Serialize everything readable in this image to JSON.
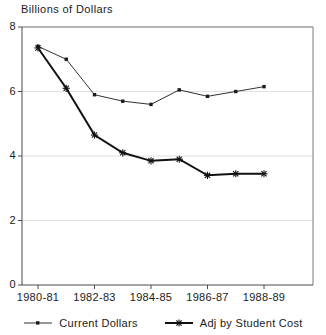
{
  "chart_data": {
    "type": "line",
    "title": "",
    "ylabel": "Billions of Dollars",
    "xlabel": "",
    "ylim": [
      0,
      8
    ],
    "yticks": [
      0,
      2,
      4,
      6,
      8
    ],
    "ytick_labels": [
      "0",
      "2",
      "4",
      "6",
      "8"
    ],
    "grid": true,
    "grid_axis": "y",
    "legend_position": "bottom",
    "x": [
      "1980-81",
      "1981-82",
      "1982-83",
      "1983-84",
      "1984-85",
      "1985-86",
      "1986-87",
      "1987-88",
      "1988-89"
    ],
    "xtick_labels": [
      "1980-81",
      "1982-83",
      "1984-85",
      "1986-87",
      "1988-89"
    ],
    "xtick_indices": [
      0,
      2,
      4,
      6,
      8
    ],
    "series": [
      {
        "name": "Current Dollars",
        "marker": "square",
        "line_width": 0.9,
        "color": "#1a1a1a",
        "values": [
          7.4,
          7.0,
          5.9,
          5.7,
          5.6,
          6.05,
          5.85,
          6.0,
          6.15
        ]
      },
      {
        "name": "Adj by Student Cost",
        "marker": "star",
        "line_width": 2.0,
        "color": "#111111",
        "values": [
          7.35,
          6.1,
          4.65,
          4.1,
          3.85,
          3.9,
          3.4,
          3.45,
          3.45
        ]
      }
    ]
  },
  "legend": {
    "entries": [
      {
        "label": "Current Dollars"
      },
      {
        "label": "Adj by Student Cost"
      }
    ]
  },
  "axes": {
    "y_title": "Billions of Dollars"
  }
}
